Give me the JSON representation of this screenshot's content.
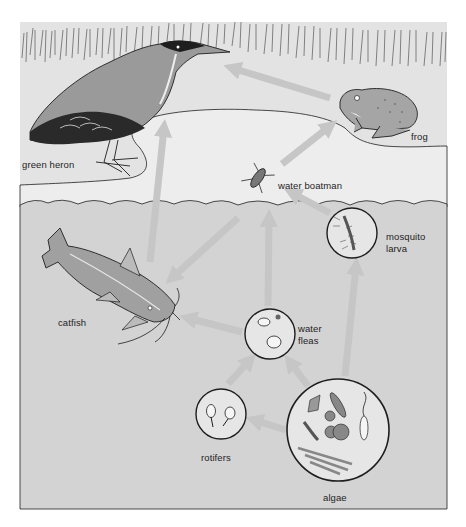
{
  "diagram": {
    "type": "food-web",
    "colors": {
      "frame_background": "#ffffff",
      "bank": "#e3e3e3",
      "pond_surface": "#ededed",
      "water": "#d3d3d3",
      "arrow": "#c6c6c6",
      "outline": "#1e1e1e",
      "label_text": "#1e1e1e"
    },
    "organisms": [
      {
        "id": "green-heron",
        "label": "green heron",
        "zone": "bank"
      },
      {
        "id": "frog",
        "label": "frog",
        "zone": "bank"
      },
      {
        "id": "water-boatman",
        "label": "water boatman",
        "zone": "surface"
      },
      {
        "id": "mosquito-larva",
        "label_line1": "mosquito",
        "label_line2": "larva",
        "zone": "water",
        "inset": "circle"
      },
      {
        "id": "catfish",
        "label": "catfish",
        "zone": "water"
      },
      {
        "id": "water-fleas",
        "label_line1": "water",
        "label_line2": "fleas",
        "zone": "water",
        "inset": "circle"
      },
      {
        "id": "rotifers",
        "label": "rotifers",
        "zone": "water",
        "inset": "circle"
      },
      {
        "id": "algae",
        "label": "algae",
        "zone": "water",
        "inset": "circle"
      }
    ],
    "arrows": [
      {
        "from": "frog",
        "to": "green-heron"
      },
      {
        "from": "water-boatman",
        "to": "frog"
      },
      {
        "from": "catfish",
        "to": "green-heron"
      },
      {
        "from": "water-boatman",
        "to": "catfish"
      },
      {
        "from": "mosquito-larva",
        "to": "water-boatman"
      },
      {
        "from": "water-fleas",
        "to": "water-boatman"
      },
      {
        "from": "water-fleas",
        "to": "catfish"
      },
      {
        "from": "rotifers",
        "to": "water-fleas"
      },
      {
        "from": "algae",
        "to": "water-fleas"
      },
      {
        "from": "algae",
        "to": "rotifers"
      },
      {
        "from": "algae",
        "to": "mosquito-larva"
      }
    ]
  }
}
